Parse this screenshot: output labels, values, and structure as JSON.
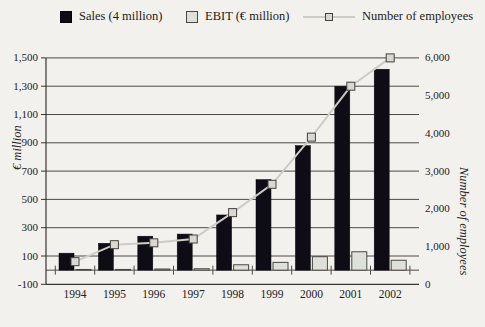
{
  "legend": {
    "items": [
      {
        "label": "Sales (4 million)",
        "swatch": "dark-filled-square",
        "color": "#0e0d15"
      },
      {
        "label": "EBIT (€ million)",
        "swatch": "light-outlined-square",
        "color": "#dde1da"
      },
      {
        "label": "Number of employees",
        "swatch": "line-with-square-marker",
        "color": "#cfccc5"
      }
    ]
  },
  "chart_data": {
    "type": "bar",
    "subtype": "dual-axis-bar-line-combo",
    "categories": [
      "1994",
      "1995",
      "1996",
      "1997",
      "1998",
      "1999",
      "2000",
      "2001",
      "2002"
    ],
    "series": [
      {
        "name": "Sales (4 million)",
        "type": "bar",
        "axis": "left",
        "color": "#0e0d15",
        "values": [
          120,
          190,
          240,
          255,
          390,
          640,
          880,
          1300,
          1420
        ]
      },
      {
        "name": "EBIT (€ million)",
        "type": "bar",
        "axis": "left",
        "color": "#dde1da",
        "values": [
          5,
          5,
          8,
          10,
          38,
          55,
          95,
          130,
          70
        ]
      },
      {
        "name": "Number of employees",
        "type": "line",
        "axis": "right",
        "color": "#cfccc5",
        "values": [
          600,
          1050,
          1100,
          1200,
          1900,
          2650,
          3900,
          5250,
          6000
        ]
      }
    ],
    "left_axis": {
      "title": "€ million",
      "min": -100,
      "max": 1500,
      "tick_step": 200,
      "tick_labels": [
        "1,500",
        "1,300",
        "1,100",
        "900",
        "700",
        "500",
        "300",
        "100",
        "-100"
      ]
    },
    "right_axis": {
      "title": "Number of employees",
      "min": 0,
      "max": 6000,
      "tick_step": 1000,
      "tick_labels": [
        "6,000",
        "5,000",
        "4,000",
        "3,000",
        "2,000",
        "1,000",
        "0"
      ]
    },
    "grid": "horizontal-on",
    "legend_position": "top",
    "bar_baseline": 0
  },
  "colors": {
    "background": "#f2f1ee",
    "gridline": "#4e4a45",
    "axis": "#38342f",
    "marker_fill": "#dbd8d2",
    "marker_border": "#45423e",
    "text": "#24201b"
  }
}
